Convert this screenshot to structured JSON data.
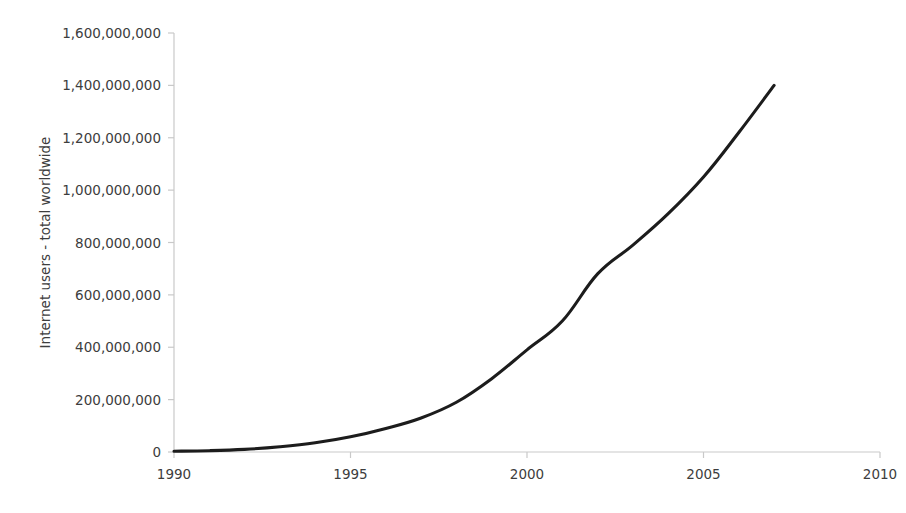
{
  "chart_data": {
    "type": "line",
    "title": "",
    "subtitle": "",
    "xlabel": "",
    "ylabel": "Internet users - total worldwide",
    "xlim": [
      1990,
      2010
    ],
    "ylim": [
      0,
      1600000000
    ],
    "grid": false,
    "legend": "none",
    "series_name": "Internet users - total worldwide",
    "line_color": "#1c1c1c",
    "axis_color": "#c9c9c9",
    "background_color": "#ffffff",
    "x_ticks": [
      1990,
      1995,
      2000,
      2005,
      2010
    ],
    "x_tick_labels": [
      "1990",
      "1995",
      "2000",
      "2005",
      "2010"
    ],
    "y_ticks": [
      0,
      200000000,
      400000000,
      600000000,
      800000000,
      1000000000,
      1200000000,
      1400000000,
      1600000000
    ],
    "y_tick_labels": [
      "0",
      "200,000,000",
      "400,000,000",
      "600,000,000",
      "800,000,000",
      "1,000,000,000",
      "1,200,000,000",
      "1,400,000,000",
      "1,600,000,000"
    ],
    "x": [
      1990,
      1991,
      1992,
      1993,
      1994,
      1995,
      1996,
      1997,
      1998,
      1999,
      2000,
      2001,
      2002,
      2003,
      2004,
      2005,
      2006,
      2007
    ],
    "values": [
      3000000,
      5000000,
      10000000,
      20000000,
      35000000,
      58000000,
      90000000,
      130000000,
      190000000,
      280000000,
      390000000,
      500000000,
      680000000,
      790000000,
      910000000,
      1050000000,
      1220000000,
      1400000000
    ]
  }
}
